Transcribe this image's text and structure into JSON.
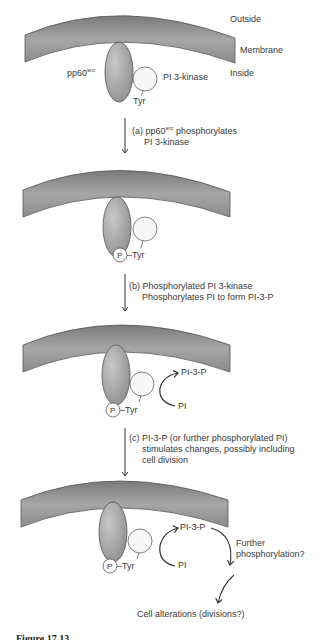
{
  "labels": {
    "outside": "Outside",
    "membrane": "Membrane",
    "inside": "Inside",
    "src_prefix": "pp60",
    "src_superscript": "src",
    "pi3k": "PI 3-kinase",
    "tyr": "Tyr",
    "p_tyr": "–Tyr",
    "phosphate": "P",
    "pi3p": "PI-3-P",
    "pi": "PI",
    "further_1": "Further",
    "further_2": "phosphorylation?",
    "cell_alterations": "Cell alterations (divisions?)"
  },
  "steps": [
    {
      "id": "a",
      "line1_prefix": "(a) pp60",
      "line1_sup": "src",
      "line1_suffix": " phosphorylates",
      "line2": "PI 3-kinase"
    },
    {
      "id": "b",
      "line1": "(b) Phosphorylated PI 3-kinase",
      "line2": "Phosphorylates PI to form PI-3-P"
    },
    {
      "id": "c",
      "line1": "(c) PI-3-P (or further phosphorylated PI)",
      "line2": "stimulates changes, possibly including",
      "line3": "cell division"
    }
  ],
  "caption": "Figure 17.13",
  "colors": {
    "membrane_dark": "#6e6e6e",
    "membrane_light": "#b4b4b4",
    "src_fill": "#a9a9a9",
    "pi3k_fill": "#f7f7f7",
    "stroke": "#444444"
  }
}
